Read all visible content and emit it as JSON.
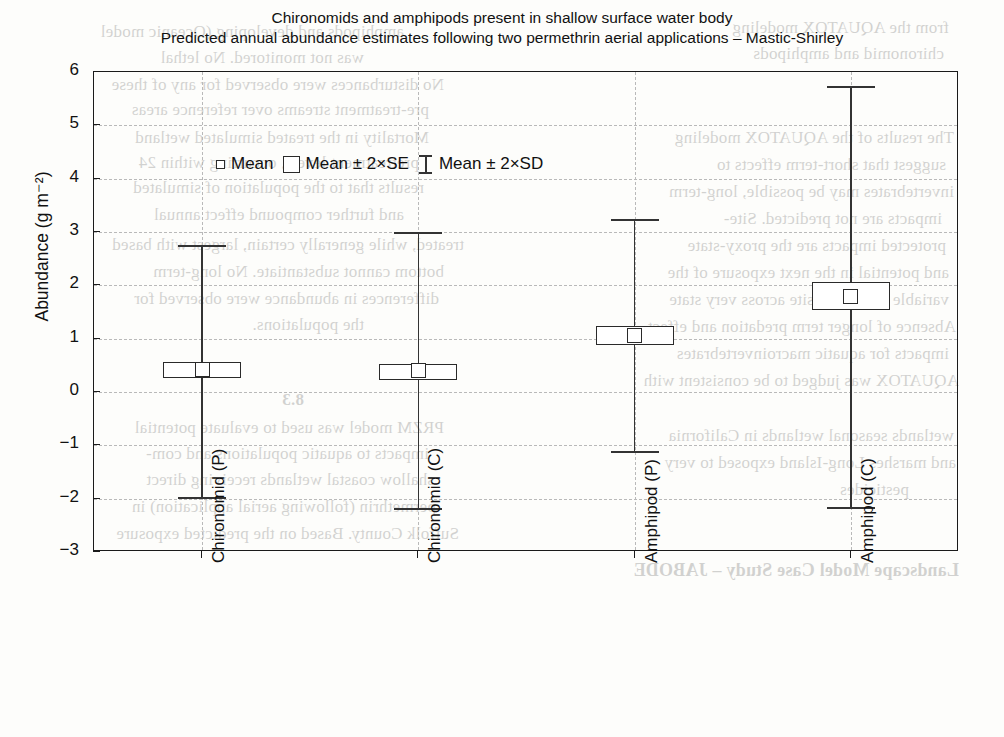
{
  "title": {
    "line1": "Chironomids and amphipods present in shallow surface water body",
    "line2": "Predicted annual abundance estimates following two permethrin aerial applications – Mastic-Shirley"
  },
  "legend": {
    "items": [
      {
        "label": "Mean",
        "marker": "small-square"
      },
      {
        "label": "Mean ± 2×SE",
        "marker": "box"
      },
      {
        "label": "Mean ± 2×SD",
        "marker": "whisker"
      }
    ]
  },
  "axes": {
    "y_title": "Abundance (g m⁻²)",
    "y_ticks": [
      "6",
      "5",
      "4",
      "3",
      "2",
      "1",
      "0",
      "−1",
      "−2",
      "−3"
    ],
    "y_min": -3,
    "y_max": 6,
    "x_labels": [
      "Chironomid (P)",
      "Chironomid (C)",
      "Amphipod (P)",
      "Amphipod (C)"
    ]
  },
  "colors": {
    "frame": "#1a1a1a",
    "grid": "#b9b9b9",
    "marker": "#2a2a2a",
    "whisker": "#333333",
    "background": "#fdfdfb"
  },
  "chart_data": {
    "type": "bar",
    "plot_style": "mean-se-sd-box-whisker",
    "xlabel": "",
    "ylabel": "Abundance (g m⁻²)",
    "ylim": [
      -3,
      6
    ],
    "yticks": [
      6,
      5,
      4,
      3,
      2,
      1,
      0,
      -1,
      -2,
      -3
    ],
    "grid": true,
    "legend_position": "top-left-inside",
    "categories": [
      "Chironomid (P)",
      "Chironomid (C)",
      "Amphipod (P)",
      "Amphipod (C)"
    ],
    "series": [
      {
        "name": "Mean",
        "values": [
          0.42,
          0.4,
          1.06,
          1.8
        ]
      },
      {
        "name": "Mean + 2×SE (box top)",
        "values": [
          0.56,
          0.53,
          1.24,
          2.07
        ]
      },
      {
        "name": "Mean − 2×SE (box bottom)",
        "values": [
          0.28,
          0.27,
          0.88,
          1.53
        ]
      },
      {
        "name": "Mean + 2×SD (upper whisker)",
        "values": [
          2.75,
          3.0,
          3.25,
          5.74
        ]
      },
      {
        "name": "Mean − 2×SD (lower whisker)",
        "values": [
          -1.97,
          -2.17,
          -1.11,
          -2.15
        ]
      }
    ],
    "points": [
      {
        "category": "Chironomid (P)",
        "mean": 0.42,
        "se_upper": 0.56,
        "se_lower": 0.28,
        "sd_upper": 2.75,
        "sd_lower": -1.97
      },
      {
        "category": "Chironomid (C)",
        "mean": 0.4,
        "se_upper": 0.53,
        "se_lower": 0.27,
        "sd_upper": 3.0,
        "sd_lower": -2.17
      },
      {
        "category": "Amphipod (P)",
        "mean": 1.06,
        "se_upper": 1.24,
        "se_lower": 0.88,
        "sd_upper": 3.25,
        "sd_lower": -1.11
      },
      {
        "category": "Amphipod (C)",
        "mean": 1.8,
        "se_upper": 2.07,
        "se_lower": 1.53,
        "sd_upper": 5.74,
        "sd_lower": -2.15
      }
    ]
  },
  "ghost_text": [
    {
      "t": "amphipods and developing (Oceanic model",
      "x": 600,
      "y": 22,
      "s": 17,
      "b": false
    },
    {
      "t": "was not monitored. No lethal",
      "x": 640,
      "y": 48,
      "s": 17,
      "b": false
    },
    {
      "t": "No disturbances were observed for any of these",
      "x": 560,
      "y": 75,
      "s": 17,
      "b": false
    },
    {
      "t": "pre-treatment streams over reference areas",
      "x": 575,
      "y": 100,
      "s": 17,
      "b": false
    },
    {
      "t": "Mortality in the treated simulated wetland",
      "x": 575,
      "y": 128,
      "s": 17,
      "b": false
    },
    {
      "t": "pretreatment levels, occurring within 24",
      "x": 585,
      "y": 153,
      "s": 17,
      "b": false
    },
    {
      "t": "results that to the population of simulated",
      "x": 580,
      "y": 178,
      "s": 17,
      "b": false
    },
    {
      "t": "and further compound effect annual",
      "x": 600,
      "y": 205,
      "s": 17,
      "b": false
    },
    {
      "t": "treated, while generally certain, largest with based",
      "x": 540,
      "y": 235,
      "s": 17,
      "b": false
    },
    {
      "t": "bottom cannot substantiate. No long-term",
      "x": 560,
      "y": 262,
      "s": 17,
      "b": false
    },
    {
      "t": "differences in abundance were observed for",
      "x": 565,
      "y": 289,
      "s": 17,
      "b": false
    },
    {
      "t": "the populations.",
      "x": 640,
      "y": 315,
      "s": 17,
      "b": false
    },
    {
      "t": "8.3",
      "x": 700,
      "y": 390,
      "s": 17,
      "b": true
    },
    {
      "t": "PRZM model was used to evaluate potential",
      "x": 560,
      "y": 418,
      "s": 17,
      "b": false
    },
    {
      "t": "impacts to aquatic populations and com-",
      "x": 575,
      "y": 444,
      "s": 17,
      "b": false
    },
    {
      "t": "shallow coastal wetlands receiving direct",
      "x": 570,
      "y": 470,
      "s": 17,
      "b": false
    },
    {
      "t": "permethrin (following aerial application) in",
      "x": 568,
      "y": 497,
      "s": 17,
      "b": false
    },
    {
      "t": "Suffolk County. Based on the predicted exposure",
      "x": 545,
      "y": 524,
      "s": 17,
      "b": false
    },
    {
      "t": "from the AQUATOX modeling",
      "x": 55,
      "y": 18,
      "s": 17,
      "b": false
    },
    {
      "t": "chironomid and amphipods",
      "x": 60,
      "y": 44,
      "s": 17,
      "b": false
    },
    {
      "t": "The results of the AQUATOX modeling",
      "x": 50,
      "y": 128,
      "s": 17,
      "b": false
    },
    {
      "t": "suggest that short-term effects to",
      "x": 58,
      "y": 155,
      "s": 17,
      "b": false
    },
    {
      "t": "invertebrates may be possible, long-term",
      "x": 50,
      "y": 182,
      "s": 17,
      "b": false
    },
    {
      "t": "impacts are not predicted. Site-",
      "x": 62,
      "y": 209,
      "s": 17,
      "b": false
    },
    {
      "t": "protected impacts are the proxy-state",
      "x": 58,
      "y": 236,
      "s": 17,
      "b": false
    },
    {
      "t": "and potential in the next exposure of the",
      "x": 55,
      "y": 263,
      "s": 17,
      "b": false
    },
    {
      "t": "variable to aquatic-site across very state",
      "x": 55,
      "y": 290,
      "s": 17,
      "b": false
    },
    {
      "t": "Absence of longer term predation and effect",
      "x": 48,
      "y": 317,
      "s": 17,
      "b": false
    },
    {
      "t": "impacts for aquatic macroinvertebrates",
      "x": 55,
      "y": 344,
      "s": 17,
      "b": false
    },
    {
      "t": "AQUATOX was judged to be consistent with",
      "x": 45,
      "y": 371,
      "s": 17,
      "b": false
    },
    {
      "t": "wetlands seasonal wetlands in California",
      "x": 50,
      "y": 426,
      "s": 17,
      "b": false
    },
    {
      "t": "and marshes Long-Island exposed to very",
      "x": 48,
      "y": 453,
      "s": 17,
      "b": false
    },
    {
      "t": "pesticides",
      "x": 95,
      "y": 480,
      "s": 17,
      "b": false
    },
    {
      "t": "Landscape Model Case Study – JABODE",
      "x": 45,
      "y": 560,
      "s": 18,
      "b": true
    }
  ]
}
